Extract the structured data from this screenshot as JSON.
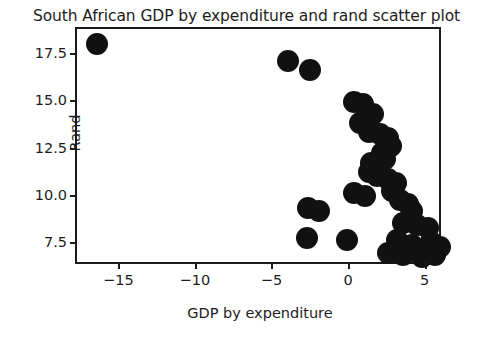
{
  "chart_data": {
    "type": "scatter",
    "title": "South African GDP by expenditure and rand scatter plot",
    "xlabel": "GDP by expenditure",
    "ylabel": "Rand",
    "grid": false,
    "legend": null,
    "marker": {
      "shape": "circle",
      "color": "#111111",
      "size_px": 22
    },
    "xlim": [
      -17.7,
      6.2
    ],
    "ylim": [
      6.2,
      18.8
    ],
    "xticks": [
      -15,
      -10,
      -5,
      0,
      5
    ],
    "xticklabels": [
      "−15",
      "−10",
      "−5",
      "0",
      "5"
    ],
    "yticks": [
      7.5,
      10.0,
      12.5,
      15.0,
      17.5
    ],
    "yticklabels": [
      "7.5",
      "10.0",
      "12.5",
      "15.0",
      "17.5"
    ],
    "points": [
      {
        "x": -16.4,
        "y": 18.0
      },
      {
        "x": -3.9,
        "y": 17.1
      },
      {
        "x": -2.5,
        "y": 16.6
      },
      {
        "x": 0.4,
        "y": 14.9
      },
      {
        "x": 1.0,
        "y": 14.8
      },
      {
        "x": 1.6,
        "y": 14.3
      },
      {
        "x": 0.8,
        "y": 13.8
      },
      {
        "x": 1.4,
        "y": 13.3
      },
      {
        "x": 2.1,
        "y": 13.2
      },
      {
        "x": 2.6,
        "y": 13.0
      },
      {
        "x": 2.8,
        "y": 12.6
      },
      {
        "x": 2.2,
        "y": 12.2
      },
      {
        "x": 2.4,
        "y": 11.9
      },
      {
        "x": 1.5,
        "y": 11.7
      },
      {
        "x": 1.4,
        "y": 11.2
      },
      {
        "x": 1.9,
        "y": 11.0
      },
      {
        "x": 2.6,
        "y": 10.8
      },
      {
        "x": 3.1,
        "y": 10.6
      },
      {
        "x": 2.9,
        "y": 10.2
      },
      {
        "x": 0.4,
        "y": 10.1
      },
      {
        "x": 1.1,
        "y": 9.9
      },
      {
        "x": 3.4,
        "y": 9.7
      },
      {
        "x": 3.9,
        "y": 9.5
      },
      {
        "x": 4.2,
        "y": 9.1
      },
      {
        "x": -2.6,
        "y": 9.3
      },
      {
        "x": -1.9,
        "y": 9.1
      },
      {
        "x": 3.6,
        "y": 8.5
      },
      {
        "x": 4.5,
        "y": 8.4
      },
      {
        "x": 5.2,
        "y": 8.2
      },
      {
        "x": -2.7,
        "y": 7.7
      },
      {
        "x": -0.1,
        "y": 7.6
      },
      {
        "x": 3.2,
        "y": 7.6
      },
      {
        "x": 4.2,
        "y": 7.3
      },
      {
        "x": 5.4,
        "y": 7.5
      },
      {
        "x": 6.0,
        "y": 7.2
      },
      {
        "x": 2.6,
        "y": 6.9
      },
      {
        "x": 3.6,
        "y": 6.8
      },
      {
        "x": 4.8,
        "y": 6.7
      },
      {
        "x": 5.7,
        "y": 6.8
      }
    ]
  }
}
